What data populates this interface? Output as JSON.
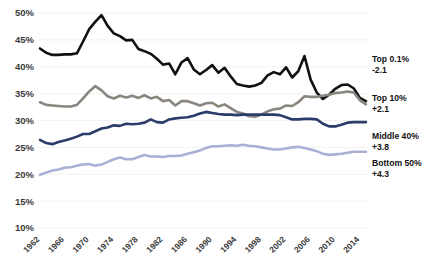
{
  "chart_data": {
    "type": "line",
    "title": "",
    "subtitle": "",
    "xlabel": "",
    "ylabel": "",
    "xlim": [
      1962,
      2015
    ],
    "ylim": [
      10,
      50
    ],
    "ytick_values": [
      50,
      45,
      40,
      35,
      30,
      25,
      20,
      15,
      10
    ],
    "ytick_labels": [
      "50%",
      "45%",
      "40%",
      "35%",
      "30%",
      "25%",
      "20%",
      "15%",
      "10%"
    ],
    "xtick_values": [
      1962,
      1966,
      1970,
      1974,
      1978,
      1982,
      1986,
      1990,
      1994,
      1998,
      2002,
      2006,
      2010,
      2014
    ],
    "xtick_labels": [
      "1962",
      "1966",
      "1970",
      "1974",
      "1978",
      "1982",
      "1986",
      "1990",
      "1994",
      "1998",
      "2002",
      "2006",
      "2010",
      "2014"
    ],
    "grid": true,
    "grid_axis": "y",
    "legend_position": "right-inline",
    "x": [
      1962,
      1963,
      1964,
      1965,
      1966,
      1967,
      1968,
      1969,
      1970,
      1971,
      1972,
      1973,
      1974,
      1975,
      1976,
      1977,
      1978,
      1979,
      1980,
      1981,
      1982,
      1983,
      1984,
      1985,
      1986,
      1987,
      1988,
      1989,
      1990,
      1991,
      1992,
      1993,
      1994,
      1995,
      1996,
      1997,
      1998,
      1999,
      2000,
      2001,
      2002,
      2003,
      2004,
      2005,
      2006,
      2007,
      2008,
      2009,
      2010,
      2011,
      2012,
      2013,
      2014,
      2015
    ],
    "series": [
      {
        "name": "Top 0.1%",
        "delta": "-2.1",
        "color": "#111111",
        "width": 2.6,
        "values": [
          43.4,
          42.6,
          42.2,
          42.2,
          42.3,
          42.3,
          42.5,
          44.7,
          47.0,
          48.4,
          49.6,
          47.6,
          46.2,
          45.7,
          44.9,
          45.0,
          43.3,
          42.9,
          42.4,
          41.5,
          40.4,
          40.6,
          38.6,
          40.8,
          41.6,
          39.5,
          38.6,
          39.4,
          40.3,
          38.9,
          39.8,
          38.2,
          36.8,
          36.5,
          36.3,
          36.5,
          37.0,
          38.4,
          39.0,
          38.6,
          39.9,
          38.0,
          39.2,
          42.0,
          37.6,
          35.2,
          34.0,
          34.8,
          35.9,
          36.6,
          36.7,
          36.0,
          34.2,
          33.6
        ]
      },
      {
        "name": "Top 10%",
        "delta": "+2.1",
        "color": "#8b857f",
        "width": 2.6,
        "values": [
          33.4,
          32.9,
          32.8,
          32.7,
          32.6,
          32.6,
          32.9,
          34.1,
          35.4,
          36.4,
          35.6,
          34.5,
          34.1,
          34.6,
          34.3,
          34.6,
          34.2,
          34.7,
          34.1,
          34.4,
          33.6,
          33.8,
          32.8,
          33.6,
          33.6,
          33.2,
          32.8,
          33.2,
          33.3,
          32.6,
          33.0,
          32.3,
          31.6,
          31.3,
          30.8,
          30.7,
          31.1,
          31.7,
          32.1,
          32.2,
          32.8,
          32.7,
          33.4,
          34.5,
          34.4,
          34.4,
          34.6,
          34.8,
          35.1,
          35.2,
          35.4,
          35.2,
          33.8,
          33.0
        ]
      },
      {
        "name": "Middle 40%",
        "delta": "+3.8",
        "color": "#2c3c6a",
        "width": 2.6,
        "values": [
          26.4,
          25.8,
          25.6,
          26.0,
          26.3,
          26.6,
          27.0,
          27.5,
          27.5,
          28.0,
          28.5,
          28.7,
          29.1,
          29.0,
          29.4,
          29.3,
          29.4,
          29.6,
          30.2,
          29.7,
          29.6,
          30.2,
          30.4,
          30.5,
          30.6,
          30.9,
          31.3,
          31.6,
          31.4,
          31.2,
          31.1,
          31.1,
          31.0,
          31.1,
          31.1,
          31.1,
          31.1,
          31.1,
          31.1,
          31.0,
          30.6,
          30.2,
          30.2,
          30.3,
          30.3,
          30.2,
          29.4,
          28.9,
          28.9,
          29.2,
          29.6,
          29.7,
          29.7,
          29.7
        ]
      },
      {
        "name": "Bottom 50%",
        "delta": "+4.3",
        "color": "#aab0d4",
        "width": 2.6,
        "values": [
          19.9,
          20.3,
          20.7,
          20.9,
          21.2,
          21.3,
          21.6,
          21.8,
          21.9,
          21.6,
          21.8,
          22.3,
          22.8,
          23.1,
          22.8,
          22.8,
          23.2,
          23.6,
          23.3,
          23.3,
          23.2,
          23.4,
          23.4,
          23.5,
          23.8,
          24.1,
          24.4,
          24.9,
          25.2,
          25.2,
          25.3,
          25.4,
          25.3,
          25.5,
          25.3,
          25.2,
          25.0,
          24.8,
          24.6,
          24.6,
          24.8,
          25.0,
          25.1,
          24.9,
          24.6,
          24.3,
          23.8,
          23.6,
          23.7,
          23.8,
          24.0,
          24.2,
          24.2,
          24.2
        ]
      }
    ]
  }
}
